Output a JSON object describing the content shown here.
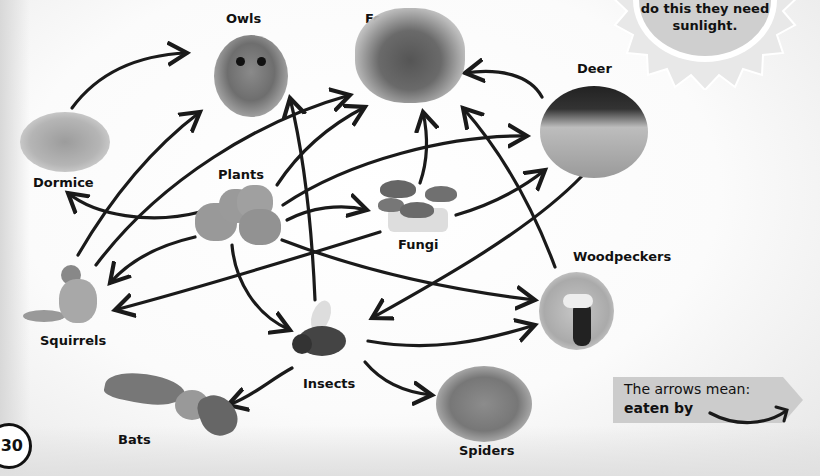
{
  "diagram": {
    "type": "food-web",
    "nodes": {
      "owls": {
        "label": "Owls"
      },
      "foxes": {
        "label": "Foxes"
      },
      "deer": {
        "label": "Deer"
      },
      "dormice": {
        "label": "Dormice"
      },
      "plants": {
        "label": "Plants"
      },
      "fungi": {
        "label": "Fungi"
      },
      "woodpeckers": {
        "label": "Woodpeckers"
      },
      "squirrels": {
        "label": "Squirrels"
      },
      "insects": {
        "label": "Insects"
      },
      "bats": {
        "label": "Bats"
      },
      "spiders": {
        "label": "Spiders"
      }
    },
    "edges": [
      {
        "from": "Dormice",
        "to": "Owls"
      },
      {
        "from": "Squirrels",
        "to": "Owls"
      },
      {
        "from": "Squirrels",
        "to": "Foxes"
      },
      {
        "from": "Plants",
        "to": "Dormice"
      },
      {
        "from": "Plants",
        "to": "Squirrels"
      },
      {
        "from": "Plants",
        "to": "Foxes"
      },
      {
        "from": "Plants",
        "to": "Deer"
      },
      {
        "from": "Plants",
        "to": "Fungi"
      },
      {
        "from": "Plants",
        "to": "Insects"
      },
      {
        "from": "Plants",
        "to": "Woodpeckers"
      },
      {
        "from": "Fungi",
        "to": "Foxes"
      },
      {
        "from": "Fungi",
        "to": "Deer"
      },
      {
        "from": "Fungi",
        "to": "Squirrels"
      },
      {
        "from": "Deer",
        "to": "Foxes"
      },
      {
        "from": "Deer",
        "to": "Insects"
      },
      {
        "from": "Woodpeckers",
        "to": "Foxes"
      },
      {
        "from": "Insects",
        "to": "Owls"
      },
      {
        "from": "Insects",
        "to": "Woodpeckers"
      },
      {
        "from": "Insects",
        "to": "Bats"
      },
      {
        "from": "Insects",
        "to": "Spiders"
      }
    ]
  },
  "sun": {
    "text_line1": "do this they need",
    "text_line2": "sunlight."
  },
  "legend": {
    "line1": "The arrows mean:",
    "line2": "eaten by"
  },
  "page_number": "30",
  "colors": {
    "arrow": "#1a1a1a",
    "sun_fill": "#cfcfcf",
    "legend_fill": "#cccccc"
  }
}
